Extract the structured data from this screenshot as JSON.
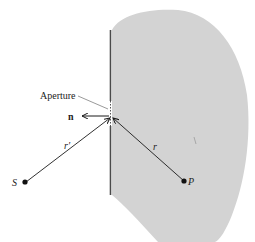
{
  "figure": {
    "type": "diffraction-geometry",
    "labels": {
      "aperture": "Aperture",
      "normal": "n",
      "source": "S",
      "point": "P",
      "r_prime": "r′",
      "r": "r"
    },
    "colors": {
      "background": "#ffffff",
      "region_fill": "#d3d3d3",
      "screen": "#4a4a4a",
      "lines": "#1a1a1a"
    }
  }
}
